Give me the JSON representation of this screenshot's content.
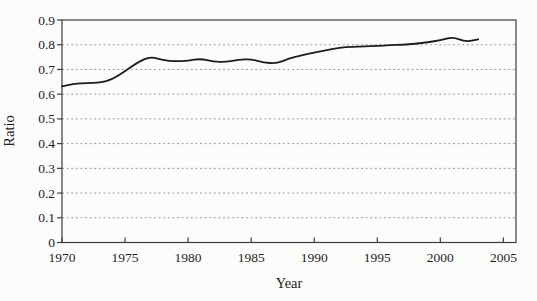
{
  "figure": {
    "background": "#fcfcfa",
    "axis_color": "#3d3d3d",
    "gridline_color": "#9b9b9b",
    "line_color": "#1c1c1c",
    "text_color": "#1e1e1e"
  },
  "chart_data": {
    "type": "line",
    "title": "",
    "xlabel": "Year",
    "ylabel": "Ratio",
    "xlim": [
      1970,
      2006
    ],
    "ylim": [
      0,
      0.9
    ],
    "xticks": [
      1970,
      1975,
      1980,
      1985,
      1990,
      1995,
      2000,
      2005
    ],
    "xtick_labels": [
      "1970",
      "1975",
      "1980",
      "1985",
      "1990",
      "1995",
      "2000",
      "2005"
    ],
    "yticks": [
      0,
      0.1,
      0.2,
      0.3,
      0.4,
      0.5,
      0.6,
      0.7,
      0.8,
      0.9
    ],
    "ytick_labels": [
      "0",
      "0.1",
      "0.2",
      "0.3",
      "0.4",
      "0.5",
      "0.6",
      "0.7",
      "0.8",
      "0.9"
    ],
    "grid": "horizontal dashed gridlines at 0.1 through 0.8; 0.9 level forms solid top border",
    "legend": "none",
    "series": [
      {
        "name": "Ratio",
        "color": "#1c1c1c",
        "x": [
          1970,
          1971,
          1972,
          1973,
          1974,
          1975,
          1976,
          1977,
          1978,
          1979,
          1980,
          1981,
          1982,
          1983,
          1984,
          1985,
          1986,
          1987,
          1988,
          1989,
          1990,
          1991,
          1992,
          1993,
          1994,
          1995,
          1996,
          1997,
          1998,
          1999,
          2000,
          2001,
          2002,
          2003
        ],
        "values": [
          0.632,
          0.643,
          0.645,
          0.646,
          0.66,
          0.693,
          0.729,
          0.752,
          0.737,
          0.733,
          0.735,
          0.744,
          0.731,
          0.73,
          0.74,
          0.742,
          0.728,
          0.724,
          0.744,
          0.757,
          0.768,
          0.779,
          0.788,
          0.792,
          0.793,
          0.795,
          0.798,
          0.8,
          0.804,
          0.81,
          0.818,
          0.832,
          0.811,
          0.822
        ]
      }
    ]
  }
}
